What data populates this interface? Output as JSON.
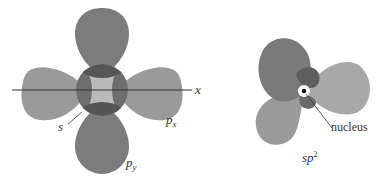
{
  "figure": {
    "left_panel": {
      "axis_label": "x",
      "labels": {
        "s": "s",
        "px_main": "p",
        "px_sub": "x",
        "py_main": "p",
        "py_sub": "y"
      },
      "colors": {
        "px_lobe": "#9a9a9a",
        "py_lobe": "#7c7c7c",
        "s_orbital": "#b4b4b4",
        "overlap_px": "#6e6e6e",
        "overlap_py": "#555555",
        "axis_line": "#333333"
      }
    },
    "right_panel": {
      "caption_main": "sp",
      "caption_sup": "2",
      "nucleus_label": "nucleus",
      "colors": {
        "lobe_dark": "#7a7a7a",
        "lobe_light": "#a8a8a8",
        "lobe_mid": "#9a9a9a",
        "overlap": "#5e5e5e",
        "nucleus_ring": "#ffffff",
        "nucleus_dot": "#111111"
      }
    }
  }
}
